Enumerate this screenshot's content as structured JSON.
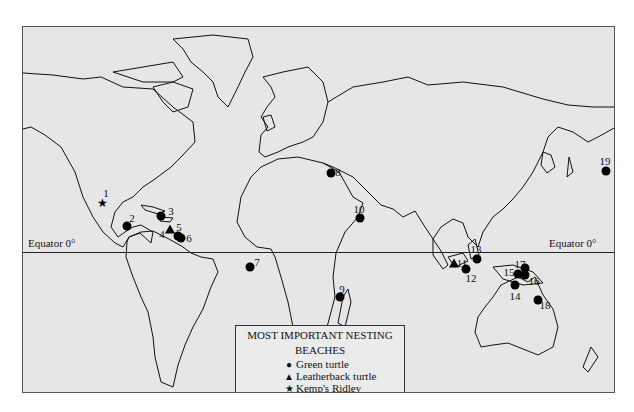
{
  "map": {
    "equator_label": "Equator 0°",
    "legend": {
      "title_line1": "MOST IMPORTANT NESTING",
      "title_line2": "BEACHES",
      "items": [
        {
          "symbol": "●",
          "label": "Green turtle"
        },
        {
          "symbol": "▲",
          "label": "Leatherback turtle"
        },
        {
          "symbol": "★",
          "label": "Kemp's Ridley"
        }
      ]
    },
    "sites": [
      {
        "n": "1",
        "type": "star"
      },
      {
        "n": "2",
        "type": "circle"
      },
      {
        "n": "3",
        "type": "circle"
      },
      {
        "n": "4",
        "type": "triangle"
      },
      {
        "n": "5",
        "type": "circle"
      },
      {
        "n": "6",
        "type": "circle"
      },
      {
        "n": "7",
        "type": "circle"
      },
      {
        "n": "8",
        "type": "circle"
      },
      {
        "n": "9",
        "type": "circle"
      },
      {
        "n": "10",
        "type": "circle"
      },
      {
        "n": "11",
        "type": "triangle"
      },
      {
        "n": "12",
        "type": "circle"
      },
      {
        "n": "13",
        "type": "circle"
      },
      {
        "n": "14",
        "type": "circle"
      },
      {
        "n": "15",
        "type": "circle"
      },
      {
        "n": "16",
        "type": "circle"
      },
      {
        "n": "17",
        "type": "circle"
      },
      {
        "n": "18",
        "type": "circle"
      },
      {
        "n": "19",
        "type": "circle"
      }
    ]
  }
}
